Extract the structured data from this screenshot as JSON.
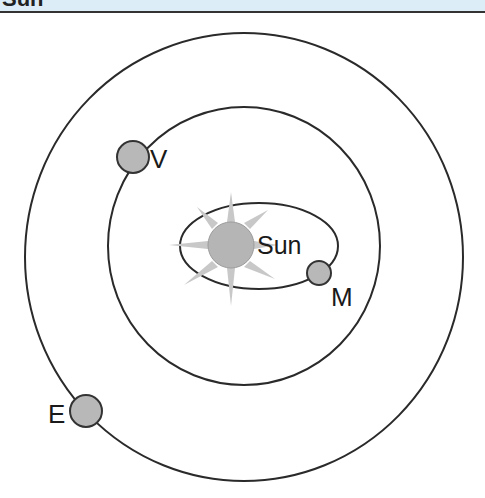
{
  "header": {
    "title": "Sun",
    "background": "#dcedf7"
  },
  "diagram": {
    "type": "solar-system-orbits",
    "colors": {
      "orbit": "#2a2a2a",
      "planet_fill": "#b8b8b8",
      "planet_stroke": "#333333",
      "sun_fill": "#b5b5b5",
      "sun_rays": "#c8c8c8"
    },
    "sun": {
      "label": "Sun",
      "cx": 231,
      "cy": 245,
      "r": 22
    },
    "orbits": [
      {
        "name": "mercury-orbit",
        "cx": 259,
        "cy": 246,
        "rx": 79,
        "ry": 43
      },
      {
        "name": "venus-orbit",
        "cx": 244,
        "cy": 246,
        "rx": 136,
        "ry": 139
      },
      {
        "name": "earth-orbit",
        "cx": 244,
        "cy": 257,
        "rx": 219,
        "ry": 224
      }
    ],
    "planets": [
      {
        "name": "venus",
        "label": "V",
        "cx": 133,
        "cy": 157,
        "r": 16,
        "lx": 150,
        "ly": 168
      },
      {
        "name": "mercury",
        "label": "M",
        "cx": 319,
        "cy": 273,
        "r": 12,
        "lx": 331,
        "ly": 305
      },
      {
        "name": "earth",
        "label": "E",
        "cx": 86,
        "cy": 411,
        "r": 17,
        "lx": 49,
        "ly": 423
      }
    ]
  }
}
